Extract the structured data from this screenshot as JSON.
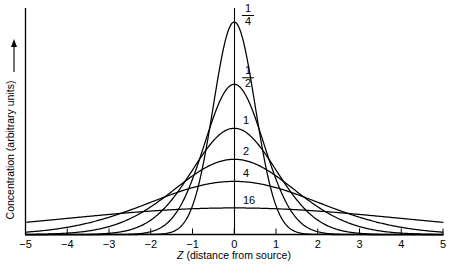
{
  "chart_data": {
    "type": "line",
    "title": "",
    "subtitle": "",
    "xlabel": "Z (distance from source)",
    "xlabel_italic_part": "Z",
    "xlabel_rest": " (distance from source)",
    "ylabel": "Concentration (arbitrary units)",
    "ylabel_arrow": "↑",
    "xlim": [
      -5,
      5
    ],
    "ylim": [
      0,
      1.0
    ],
    "grid": false,
    "legend_position": "inline-labels-at-peak",
    "xticks": [
      -5,
      -4,
      -3,
      -2,
      -1,
      0,
      1,
      2,
      3,
      4,
      5
    ],
    "xtick_labels": [
      "−5",
      "−4",
      "−3",
      "−2",
      "−1",
      "0",
      "1",
      "2",
      "3",
      "4",
      "5"
    ],
    "yticks": [],
    "ytick_labels": [],
    "center_axis_x": 0,
    "series": [
      {
        "name": "1/4",
        "label_numerator": "1",
        "label_denominator": "4",
        "label_is_fraction": true,
        "dt": 0.25,
        "peak_value": 1.0,
        "sigma": 0.5,
        "values_x": [
          -5,
          -4.5,
          -4,
          -3.5,
          -3,
          -2.5,
          -2,
          -1.75,
          -1.5,
          -1.25,
          -1,
          -0.75,
          -0.5,
          -0.25,
          0,
          0.25,
          0.5,
          0.75,
          1,
          1.25,
          1.5,
          1.75,
          2,
          2.5,
          3,
          3.5,
          4,
          4.5,
          5
        ],
        "values_y": [
          0.0,
          0.0,
          0.0,
          0.0,
          0.0001,
          0.0019,
          0.0183,
          0.0468,
          0.1054,
          0.2096,
          0.3679,
          0.5698,
          0.7788,
          0.8825,
          1.0,
          0.8825,
          0.7788,
          0.5698,
          0.3679,
          0.2096,
          0.1054,
          0.0468,
          0.0183,
          0.0019,
          0.0001,
          0.0,
          0.0,
          0.0,
          0.0
        ]
      },
      {
        "name": "1/2",
        "label_numerator": "1",
        "label_denominator": "2",
        "label_is_fraction": true,
        "dt": 0.5,
        "peak_value": 0.707,
        "sigma": 0.707,
        "values_x": [
          -5,
          -4.5,
          -4,
          -3.5,
          -3,
          -2.5,
          -2,
          -1.75,
          -1.5,
          -1.25,
          -1,
          -0.75,
          -0.5,
          -0.25,
          0,
          0.25,
          0.5,
          0.75,
          1,
          1.25,
          1.5,
          1.75,
          2,
          2.5,
          3,
          3.5,
          4,
          4.5,
          5
        ],
        "values_y": [
          0.0,
          0.0,
          0.0002,
          0.0014,
          0.0079,
          0.0303,
          0.0958,
          0.1533,
          0.2292,
          0.3219,
          0.4288,
          0.5437,
          0.6192,
          0.6845,
          0.707,
          0.6845,
          0.6192,
          0.5437,
          0.4288,
          0.3219,
          0.2292,
          0.1533,
          0.0958,
          0.0303,
          0.0079,
          0.0014,
          0.0002,
          0.0,
          0.0
        ]
      },
      {
        "name": "1",
        "label_numerator": "1",
        "label_denominator": "",
        "label_is_fraction": false,
        "dt": 1,
        "peak_value": 0.5,
        "sigma": 1.0,
        "values_x": [
          -5,
          -4.5,
          -4,
          -3.5,
          -3,
          -2.5,
          -2,
          -1.75,
          -1.5,
          -1.25,
          -1,
          -0.75,
          -0.5,
          -0.25,
          0,
          0.25,
          0.5,
          0.75,
          1,
          1.25,
          1.5,
          1.75,
          2,
          2.5,
          3,
          3.5,
          4,
          4.5,
          5
        ],
        "values_y": [
          0.0,
          0.0001,
          0.0003,
          0.0011,
          0.0056,
          0.0216,
          0.0677,
          0.1097,
          0.1654,
          0.2345,
          0.3033,
          0.3745,
          0.4412,
          0.4849,
          0.5,
          0.4849,
          0.4412,
          0.3745,
          0.3033,
          0.2345,
          0.1654,
          0.1097,
          0.0677,
          0.0216,
          0.0056,
          0.0011,
          0.0003,
          0.0001,
          0.0
        ]
      },
      {
        "name": "2",
        "label_numerator": "2",
        "label_denominator": "",
        "label_is_fraction": false,
        "dt": 2,
        "peak_value": 0.354,
        "sigma": 1.414,
        "values_x": [
          -5,
          -4.5,
          -4,
          -3.5,
          -3,
          -2.5,
          -2,
          -1.75,
          -1.5,
          -1.25,
          -1,
          -0.75,
          -0.5,
          -0.25,
          0,
          0.25,
          0.5,
          0.75,
          1,
          1.25,
          1.5,
          1.75,
          2,
          2.5,
          3,
          3.5,
          4,
          4.5,
          5
        ],
        "values_y": [
          0.0015,
          0.0043,
          0.0114,
          0.0276,
          0.0611,
          0.1237,
          0.2146,
          0.267,
          0.3037,
          0.3231,
          0.3268,
          0.3133,
          0.2896,
          0.2589,
          0.354,
          0.2589,
          0.2896,
          0.3133,
          0.3268,
          0.3231,
          0.3037,
          0.267,
          0.2146,
          0.1237,
          0.0611,
          0.0276,
          0.0114,
          0.0043,
          0.0015
        ]
      },
      {
        "name": "4",
        "label_numerator": "4",
        "label_denominator": "",
        "label_is_fraction": false,
        "dt": 4,
        "peak_value": 0.25,
        "sigma": 2.0,
        "values_x": [
          -5,
          -4.5,
          -4,
          -3.5,
          -3,
          -2.5,
          -2,
          -1.5,
          -1,
          -0.5,
          0,
          0.5,
          1,
          1.5,
          2,
          2.5,
          3,
          3.5,
          4,
          4.5,
          5
        ],
        "values_y": [
          0.011,
          0.0183,
          0.0293,
          0.045,
          0.0661,
          0.093,
          0.1251,
          0.1867,
          0.2431,
          0.2813,
          0.25,
          0.2813,
          0.2431,
          0.1867,
          0.1251,
          0.093,
          0.0661,
          0.045,
          0.0293,
          0.0183,
          0.011
        ]
      },
      {
        "name": "16",
        "label_numerator": "16",
        "label_denominator": "",
        "label_is_fraction": false,
        "dt": 16,
        "peak_value": 0.125,
        "sigma": 4.0,
        "values_x": [
          -5,
          -4,
          -3,
          -2,
          -1,
          0,
          1,
          2,
          3,
          4,
          5
        ],
        "values_y": [
          0.091,
          0.1037,
          0.1138,
          0.1206,
          0.1242,
          0.125,
          0.1242,
          0.1206,
          0.1138,
          0.1037,
          0.091
        ]
      }
    ]
  },
  "axes": {
    "x_axis_name": "x-axis",
    "y_axis_name": "y-axis",
    "center_axis_name": "center-vertical-axis"
  },
  "colors": {
    "background": "#ffffff",
    "ink": "#000000",
    "curve": "#000000"
  }
}
